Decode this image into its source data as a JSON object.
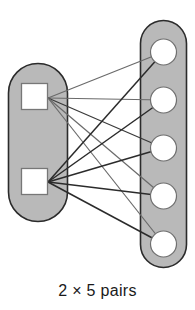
{
  "figure": {
    "caption": "2 × 5 pairs",
    "colors": {
      "background": "#ffffff",
      "capsule_fill": "#b9b9b9",
      "capsule_stroke": "#2b2b2b",
      "node_fill": "#ffffff",
      "node_stroke": "#6f6f6f",
      "edge_dark": "#2b2b2b",
      "edge_light": "#6a6a6a",
      "caption_color": "#1a1a1a"
    },
    "left_group": {
      "name": "left-capsule",
      "shape": "capsule",
      "x": 8,
      "y": 63,
      "width": 60,
      "height": 159,
      "node_shape": "square",
      "node_count": 2,
      "nodes": [
        {
          "id": "L1",
          "label": "",
          "cx": 34.5,
          "cy": 96.5,
          "size": 27
        },
        {
          "id": "L2",
          "label": "",
          "cx": 34.5,
          "cy": 181.5,
          "size": 27
        }
      ],
      "anchors": [
        {
          "id": "L1",
          "x": 48,
          "y": 98
        },
        {
          "id": "L2",
          "x": 48,
          "y": 182
        }
      ]
    },
    "right_group": {
      "name": "right-capsule",
      "shape": "capsule",
      "x": 140,
      "y": 20,
      "width": 47,
      "height": 248,
      "node_shape": "circle",
      "node_count": 5,
      "nodes": [
        {
          "id": "R1",
          "label": "",
          "cx": 163.5,
          "cy": 52,
          "r": 13
        },
        {
          "id": "R2",
          "label": "",
          "cx": 163.5,
          "cy": 100,
          "r": 13
        },
        {
          "id": "R3",
          "label": "",
          "cx": 163.5,
          "cy": 148,
          "r": 13
        },
        {
          "id": "R4",
          "label": "",
          "cx": 163.5,
          "cy": 196,
          "r": 13
        },
        {
          "id": "R5",
          "label": "",
          "cx": 163.5,
          "cy": 244,
          "r": 13
        }
      ]
    },
    "edges": [
      {
        "id": "L1-R1",
        "from": "L1",
        "to": "R1",
        "x1": 48,
        "y1": 98,
        "x2": 163.5,
        "y2": 52,
        "tone": "light"
      },
      {
        "id": "L1-R2",
        "from": "L1",
        "to": "R2",
        "x1": 48,
        "y1": 98,
        "x2": 163.5,
        "y2": 100,
        "tone": "light"
      },
      {
        "id": "L1-R3",
        "from": "L1",
        "to": "R3",
        "x1": 48,
        "y1": 98,
        "x2": 163.5,
        "y2": 148,
        "tone": "dark"
      },
      {
        "id": "L1-R4",
        "from": "L1",
        "to": "R4",
        "x1": 48,
        "y1": 98,
        "x2": 163.5,
        "y2": 196,
        "tone": "light"
      },
      {
        "id": "L1-R5",
        "from": "L1",
        "to": "R5",
        "x1": 48,
        "y1": 98,
        "x2": 163.5,
        "y2": 244,
        "tone": "light"
      },
      {
        "id": "L2-R1",
        "from": "L2",
        "to": "R1",
        "x1": 48,
        "y1": 182,
        "x2": 163.5,
        "y2": 52,
        "tone": "dark"
      },
      {
        "id": "L2-R2",
        "from": "L2",
        "to": "R2",
        "x1": 48,
        "y1": 182,
        "x2": 163.5,
        "y2": 100,
        "tone": "dark"
      },
      {
        "id": "L2-R3",
        "from": "L2",
        "to": "R3",
        "x1": 48,
        "y1": 182,
        "x2": 163.5,
        "y2": 148,
        "tone": "dark"
      },
      {
        "id": "L2-R4",
        "from": "L2",
        "to": "R4",
        "x1": 48,
        "y1": 182,
        "x2": 163.5,
        "y2": 196,
        "tone": "dark"
      },
      {
        "id": "L2-R5",
        "from": "L2",
        "to": "R5",
        "x1": 48,
        "y1": 182,
        "x2": 163.5,
        "y2": 244,
        "tone": "dark"
      }
    ],
    "edge_count": 10
  }
}
